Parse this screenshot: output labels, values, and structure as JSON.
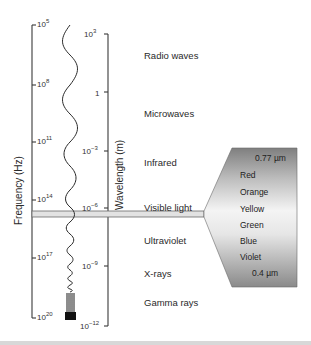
{
  "frequency_axis": {
    "title": "Frequency (Hz)",
    "ticks": [
      {
        "base": "10",
        "exp": "5"
      },
      {
        "base": "10",
        "exp": "8"
      },
      {
        "base": "10",
        "exp": "11"
      },
      {
        "base": "10",
        "exp": "14"
      },
      {
        "base": "10",
        "exp": "17"
      },
      {
        "base": "10",
        "exp": "20"
      }
    ]
  },
  "wavelength_axis": {
    "title": "Wavelength (m)",
    "ticks": [
      {
        "base": "10",
        "exp": "3"
      },
      {
        "base": "1",
        "exp": ""
      },
      {
        "base": "10",
        "exp": "−3"
      },
      {
        "base": "10",
        "exp": "−6"
      },
      {
        "base": "10",
        "exp": "−9"
      },
      {
        "base": "10",
        "exp": "−12"
      }
    ]
  },
  "regions": [
    {
      "label": "Radio waves"
    },
    {
      "label": "Microwaves"
    },
    {
      "label": "Infrared"
    },
    {
      "label": "Visible light"
    },
    {
      "label": "Ultraviolet"
    },
    {
      "label": "X-rays"
    },
    {
      "label": "Gamma rays"
    }
  ],
  "visible_spectrum": {
    "top_wavelength": "0.77 µm",
    "colors": [
      "Red",
      "Orange",
      "Yellow",
      "Green",
      "Blue",
      "Violet"
    ],
    "bottom_wavelength": "0.4 µm"
  },
  "colors": {
    "axis": "#3a3a3a",
    "band_fill": "#e2e2e2",
    "box_dark": "#8a8a8a",
    "box_light": "#f2f2f2",
    "divider": "#d8d8d8"
  }
}
